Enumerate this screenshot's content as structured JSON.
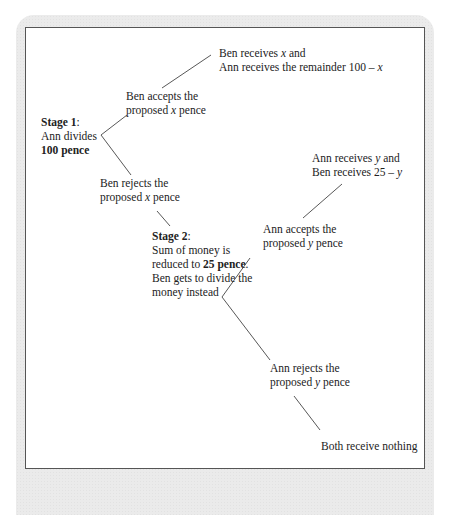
{
  "diagram": {
    "type": "game-tree",
    "nodes": {
      "stage1": {
        "title": "Stage 1",
        "title_suffix": ":",
        "line2": "Ann divides",
        "line3": "100 pence"
      },
      "ben_accepts": {
        "line1": "Ben accepts the",
        "line2_pre": "proposed ",
        "line2_var": "x",
        "line2_post": " pence"
      },
      "ben_accepts_outcome": {
        "line1_pre": "Ben receives ",
        "line1_var": "x",
        "line1_post": " and",
        "line2_pre": "Ann receives the remainder 100 – ",
        "line2_var": "x"
      },
      "ben_rejects": {
        "line1": "Ben rejects the",
        "line2_pre": "proposed ",
        "line2_var": "x",
        "line2_post": " pence"
      },
      "stage2": {
        "title": "Stage 2",
        "title_suffix": ":",
        "line2": "Sum of money is",
        "line3_pre": "reduced to ",
        "line3_bold": "25 pence",
        "line3_post": ".",
        "line4": "Ben gets to divide the",
        "line5": "money instead"
      },
      "ann_accepts": {
        "line1": "Ann accepts the",
        "line2_pre": "proposed ",
        "line2_var": "y",
        "line2_post": " pence"
      },
      "ann_accepts_outcome": {
        "line1_pre": "Ann receives ",
        "line1_var": "y",
        "line1_post": " and",
        "line2_pre": "Ben receives 25 – ",
        "line2_var": "y"
      },
      "ann_rejects": {
        "line1": "Ann rejects the",
        "line2_pre": "proposed ",
        "line2_var": "y",
        "line2_post": " pence"
      },
      "ann_rejects_outcome": {
        "line1": "Both receive nothing"
      }
    }
  }
}
